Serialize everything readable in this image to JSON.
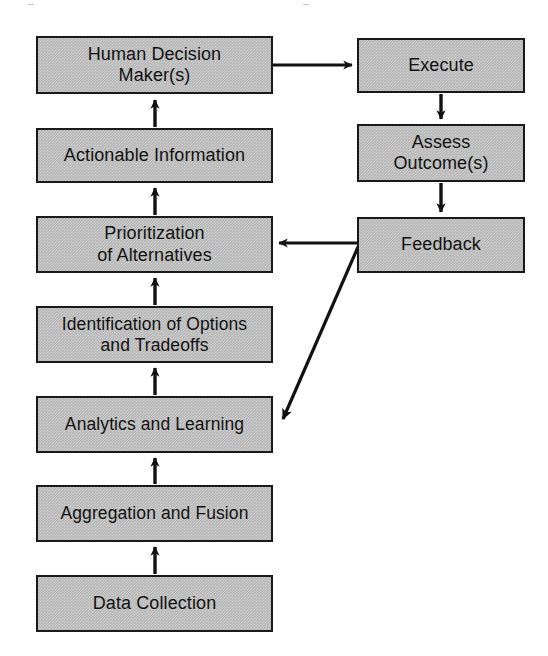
{
  "diagram": {
    "type": "flowchart",
    "title": "",
    "background_color": "#ffffff",
    "node_fill_color": "#b6b6b6",
    "node_border_color": "#1a1a1a",
    "edge_color": "#111111",
    "text_color": "#121212",
    "nodes": [
      {
        "id": "human-decision-maker",
        "label": "Human Decision\nMaker(s)",
        "column": "left",
        "x": 36,
        "y": 36,
        "w": 237,
        "h": 58
      },
      {
        "id": "actionable-information",
        "label": "Actionable Information",
        "column": "left",
        "x": 36,
        "y": 128,
        "w": 237,
        "h": 55
      },
      {
        "id": "prioritization-of-alternatives",
        "label": "Prioritization\nof Alternatives",
        "column": "left",
        "x": 36,
        "y": 216,
        "w": 237,
        "h": 57
      },
      {
        "id": "identification-of-options-and-tradeoffs",
        "label": "Identification of Options\nand Tradeoffs",
        "column": "left",
        "x": 36,
        "y": 306,
        "w": 237,
        "h": 57
      },
      {
        "id": "analytics-and-learning",
        "label": "Analytics and Learning",
        "column": "left",
        "x": 36,
        "y": 396,
        "w": 237,
        "h": 57
      },
      {
        "id": "aggregation-and-fusion",
        "label": "Aggregation and Fusion",
        "column": "left",
        "x": 36,
        "y": 485,
        "w": 237,
        "h": 57
      },
      {
        "id": "data-collection",
        "label": "Data Collection",
        "column": "left",
        "x": 36,
        "y": 575,
        "w": 237,
        "h": 57
      },
      {
        "id": "execute",
        "label": "Execute",
        "column": "right",
        "x": 357,
        "y": 38,
        "w": 168,
        "h": 55
      },
      {
        "id": "assess-outcomes",
        "label": "Assess\nOutcome(s)",
        "column": "right",
        "x": 357,
        "y": 124,
        "w": 168,
        "h": 58
      },
      {
        "id": "feedback",
        "label": "Feedback",
        "column": "right",
        "x": 357,
        "y": 217,
        "w": 168,
        "h": 56
      }
    ],
    "edges": [
      {
        "id": "data-collection-to-aggregation",
        "from": "data-collection",
        "to": "aggregation-and-fusion",
        "direction": "up"
      },
      {
        "id": "aggregation-to-analytics",
        "from": "aggregation-and-fusion",
        "to": "analytics-and-learning",
        "direction": "up"
      },
      {
        "id": "analytics-to-identification",
        "from": "analytics-and-learning",
        "to": "identification-of-options-and-tradeoffs",
        "direction": "up"
      },
      {
        "id": "identification-to-prioritization",
        "from": "identification-of-options-and-tradeoffs",
        "to": "prioritization-of-alternatives",
        "direction": "up"
      },
      {
        "id": "prioritization-to-actionable",
        "from": "prioritization-of-alternatives",
        "to": "actionable-information",
        "direction": "up"
      },
      {
        "id": "actionable-to-human-decision-maker",
        "from": "actionable-information",
        "to": "human-decision-maker",
        "direction": "up"
      },
      {
        "id": "human-decision-maker-to-execute",
        "from": "human-decision-maker",
        "to": "execute",
        "direction": "right"
      },
      {
        "id": "execute-to-assess-outcomes",
        "from": "execute",
        "to": "assess-outcomes",
        "direction": "down"
      },
      {
        "id": "assess-outcomes-to-feedback",
        "from": "assess-outcomes",
        "to": "feedback",
        "direction": "down"
      },
      {
        "id": "feedback-to-prioritization",
        "from": "feedback",
        "to": "prioritization-of-alternatives",
        "direction": "left"
      },
      {
        "id": "feedback-to-analytics",
        "from": "feedback",
        "to": "analytics-and-learning",
        "direction": "diagonal-down-left"
      }
    ]
  }
}
